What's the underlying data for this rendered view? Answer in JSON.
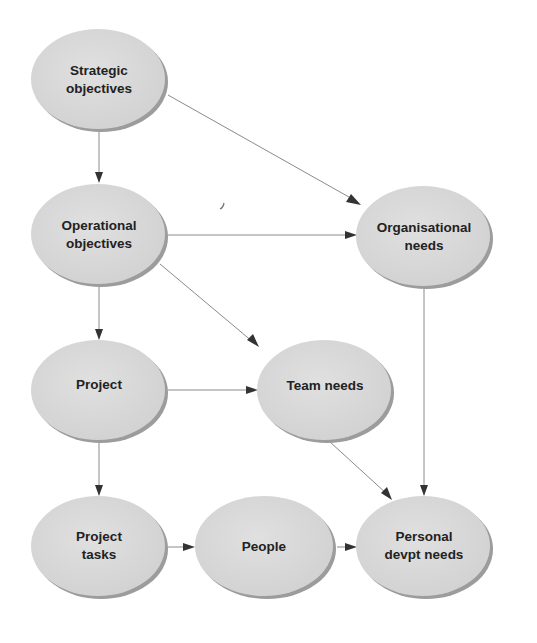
{
  "diagram": {
    "type": "flow-diagram",
    "nodes": [
      {
        "id": "strategic",
        "lines": [
          "Strategic",
          "objectives"
        ],
        "cx": 99,
        "cy": 80
      },
      {
        "id": "operational",
        "lines": [
          "Operational",
          "objectives"
        ],
        "cx": 99,
        "cy": 235
      },
      {
        "id": "organisational",
        "lines": [
          "Organisational",
          "needs"
        ],
        "cx": 424,
        "cy": 237
      },
      {
        "id": "project",
        "lines": [
          "Project"
        ],
        "cx": 99,
        "cy": 391
      },
      {
        "id": "team",
        "lines": [
          "Team needs"
        ],
        "cx": 325,
        "cy": 391
      },
      {
        "id": "tasks",
        "lines": [
          "Project",
          "tasks"
        ],
        "cx": 99,
        "cy": 547
      },
      {
        "id": "people",
        "lines": [
          "People"
        ],
        "cx": 264,
        "cy": 547
      },
      {
        "id": "personal",
        "lines": [
          "Personal",
          "devpt needs"
        ],
        "cx": 424,
        "cy": 547
      }
    ],
    "edges": [
      {
        "from": "strategic",
        "to": "operational"
      },
      {
        "from": "strategic",
        "to": "organisational"
      },
      {
        "from": "operational",
        "to": "organisational"
      },
      {
        "from": "operational",
        "to": "project"
      },
      {
        "from": "operational",
        "to": "team"
      },
      {
        "from": "project",
        "to": "team"
      },
      {
        "from": "project",
        "to": "tasks"
      },
      {
        "from": "organisational",
        "to": "personal"
      },
      {
        "from": "team",
        "to": "personal"
      },
      {
        "from": "tasks",
        "to": "people"
      },
      {
        "from": "people",
        "to": "personal"
      }
    ],
    "colors": {
      "node_fill": "#d9d9d9",
      "node_shadow": "#9c9c9c",
      "text": "#222222",
      "edge": "#8a8a8a",
      "arrowhead": "#333333"
    }
  }
}
